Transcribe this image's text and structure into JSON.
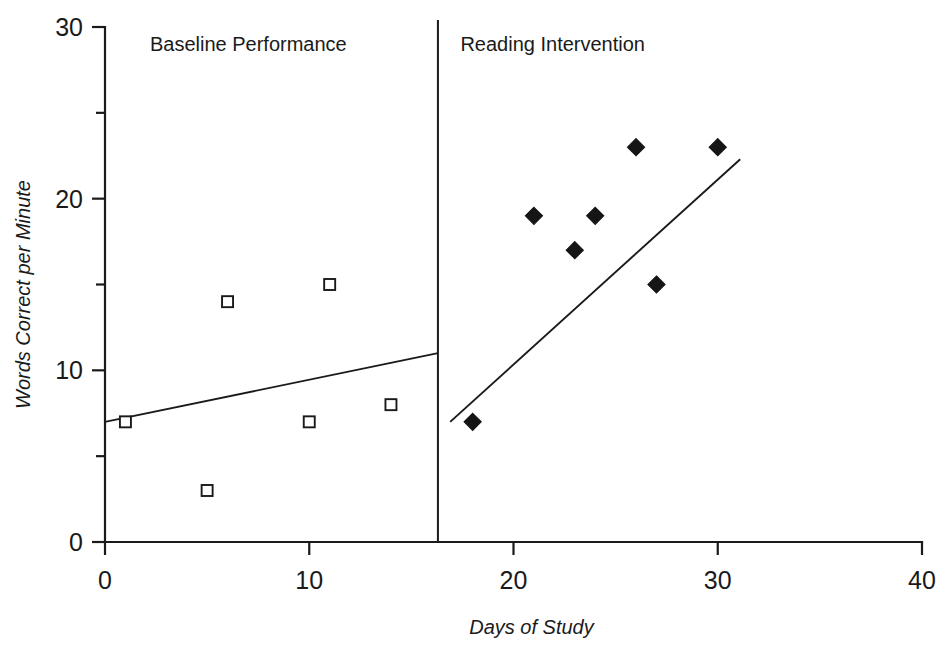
{
  "chart_data": {
    "type": "scatter",
    "title": "",
    "xlabel": "Days of Study",
    "ylabel": "Words Correct per Minute",
    "xlim": [
      0,
      40
    ],
    "ylim": [
      0,
      30
    ],
    "x_ticks": [
      0,
      10,
      20,
      30,
      40
    ],
    "x_tick_labels": [
      "0",
      "10",
      "20",
      "30",
      "40"
    ],
    "y_ticks": [
      0,
      10,
      20,
      30
    ],
    "y_tick_labels": [
      "0",
      "10",
      "20",
      "30"
    ],
    "y_minor_ticks": [
      5,
      15,
      25
    ],
    "grid": false,
    "legend": false,
    "phase_change_line_x": 16.3,
    "annotations": [
      {
        "text": "Baseline Performance",
        "x": 2.2,
        "y": 28.6
      },
      {
        "text": "Reading Intervention",
        "x": 17.4,
        "y": 28.6
      }
    ],
    "series": [
      {
        "name": "Baseline Performance",
        "marker": "open-square",
        "points": [
          {
            "x": 1,
            "y": 7
          },
          {
            "x": 5,
            "y": 3
          },
          {
            "x": 6,
            "y": 14
          },
          {
            "x": 10,
            "y": 7
          },
          {
            "x": 11,
            "y": 15
          },
          {
            "x": 14,
            "y": 8
          }
        ],
        "trend_line": {
          "x1": 0,
          "y1": 7,
          "x2": 16.3,
          "y2": 11
        }
      },
      {
        "name": "Reading Intervention",
        "marker": "filled-diamond",
        "points": [
          {
            "x": 18,
            "y": 7
          },
          {
            "x": 21,
            "y": 19
          },
          {
            "x": 23,
            "y": 17
          },
          {
            "x": 24,
            "y": 19
          },
          {
            "x": 26,
            "y": 23
          },
          {
            "x": 27,
            "y": 15
          },
          {
            "x": 30,
            "y": 23
          }
        ],
        "trend_line": {
          "x1": 16.9,
          "y1": 7,
          "x2": 31.1,
          "y2": 22.3
        }
      }
    ],
    "colors": {
      "ink": "#1a1a1a",
      "marker_fill": "#151515",
      "background": "#ffffff"
    }
  }
}
